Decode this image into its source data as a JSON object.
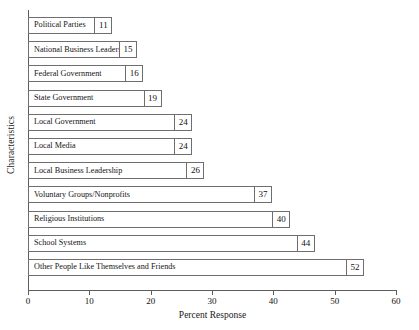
{
  "chart_data": {
    "type": "bar",
    "orientation": "horizontal",
    "title": "",
    "xlabel": "Percent Response",
    "ylabel": "Characteristics",
    "xlim": [
      0,
      60
    ],
    "xticks": [
      0,
      10,
      20,
      30,
      40,
      50,
      60
    ],
    "grid": false,
    "legend": null,
    "categories": [
      "Political Parties",
      "National Business Leadership",
      "Federal Government",
      "State Government",
      "Local Government",
      "Local Media",
      "Local Business Leadership",
      "Voluntary Groups/Nonprofits",
      "Religious Institutions",
      "School Systems",
      "Other People Like Themselves and Friends"
    ],
    "values": [
      11,
      15,
      16,
      19,
      24,
      24,
      26,
      37,
      40,
      44,
      52
    ],
    "bars": [
      {
        "label": "Political Parties",
        "value": 11
      },
      {
        "label": "National Business Leadership",
        "value": 15
      },
      {
        "label": "Federal Government",
        "value": 16
      },
      {
        "label": "State Government",
        "value": 19
      },
      {
        "label": "Local Government",
        "value": 24
      },
      {
        "label": "Local Media",
        "value": 24
      },
      {
        "label": "Local Business Leadership",
        "value": 26
      },
      {
        "label": "Voluntary Groups/Nonprofits",
        "value": 37
      },
      {
        "label": "Religious Institutions",
        "value": 40
      },
      {
        "label": "School Systems",
        "value": 44
      },
      {
        "label": "Other People Like Themselves and Friends",
        "value": 52
      }
    ],
    "colors": {
      "bar_fill": "#ffffff",
      "bar_border": "#6e6e6e",
      "axis": "#5d5d5d",
      "text": "#111111",
      "background": "#ffffff"
    }
  }
}
